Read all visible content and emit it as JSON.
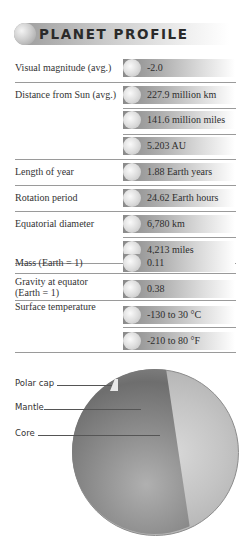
{
  "header": {
    "title": "PLANET PROFILE"
  },
  "rows": [
    {
      "label": "Visual magnitude (avg.)",
      "values": [
        "-2.0"
      ]
    },
    {
      "label": "Distance from Sun (avg.)",
      "values": [
        "227.9 million km",
        "141.6 million miles",
        "5.203 AU"
      ]
    },
    {
      "label": "Length of year",
      "values": [
        "1.88 Earth years"
      ]
    },
    {
      "label": "Rotation period",
      "values": [
        "24.62 Earth hours"
      ]
    },
    {
      "label": "Equatorial diameter",
      "values": [
        "6,780 km",
        "4,213 miles"
      ]
    },
    {
      "label": "Mass (Earth = 1)",
      "values": [
        "0.11"
      ]
    },
    {
      "label": "Gravity at equator (Earth = 1)",
      "values": [
        "0.38"
      ]
    },
    {
      "label": "Surface temperature",
      "values": [
        "-130 to 30 °C",
        "-210 to 80 °F"
      ]
    }
  ],
  "diagram": {
    "labels": [
      "Polar cap",
      "Mantle",
      "Core"
    ]
  }
}
